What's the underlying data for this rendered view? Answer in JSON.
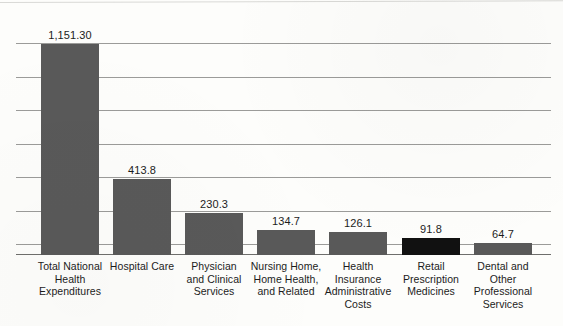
{
  "chart_data": {
    "type": "bar",
    "title": "",
    "subtitle": "",
    "xlabel": "",
    "ylabel": "",
    "categories": [
      "Total National Health Expenditures",
      "Hospital Care",
      "Physician and Clinical Services",
      "Nursing Home, Home Health, and Related",
      "Health Insurance Administrative Costs",
      "Retail Prescription Medicines",
      "Dental and Other Professional Services"
    ],
    "category_lines": [
      [
        "Total National",
        "Health",
        "Expenditures"
      ],
      [
        "Hospital Care"
      ],
      [
        "Physician",
        "and Clinical",
        "Services"
      ],
      [
        "Nursing Home,",
        "Home Health,",
        "and Related"
      ],
      [
        "Health",
        "Insurance",
        "Administrative",
        "Costs"
      ],
      [
        "Retail",
        "Prescription",
        "Medicines"
      ],
      [
        "Dental and",
        "Other",
        "Professional",
        "Services"
      ]
    ],
    "values": [
      1151.3,
      413.8,
      230.3,
      134.7,
      126.1,
      91.8,
      64.7
    ],
    "value_labels": [
      "1,151.30",
      "413.8",
      "230.3",
      "134.7",
      "126.1",
      "91.8",
      "64.7"
    ],
    "bar_colors": [
      "#595959",
      "#595959",
      "#595959",
      "#595959",
      "#595959",
      "#111111",
      "#595959"
    ],
    "highlight_index": 5,
    "ylim": [
      0,
      1151.3
    ],
    "gridlines": true,
    "gridline_count": 7,
    "gridline_values": [
      0,
      183,
      366,
      549,
      732,
      915,
      1098,
      1151.3
    ],
    "y_tick_labels": [],
    "legend": [],
    "legend_position": "none",
    "grid_color": "#9b9b99",
    "background_color": "#fdfdfb",
    "text_color": "#1c1c1c"
  },
  "geometry": {
    "plot_left": 16,
    "plot_top": 43,
    "plot_width": 535,
    "plot_height": 212,
    "bar_centers": [
      54,
      126,
      198,
      270,
      342,
      415,
      487
    ],
    "bar_width": 58,
    "bar_pixel_heights": [
      211,
      76,
      42,
      25,
      23,
      17,
      12
    ],
    "gridline_y": [
      0,
      33.5,
      67,
      100.5,
      134,
      167.5,
      201,
      211
    ],
    "category_top": 260
  }
}
